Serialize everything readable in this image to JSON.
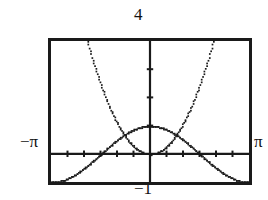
{
  "screen": {
    "name": "graphing-calculator-plot",
    "background": "#ffffff",
    "ink": "#1a1a1a"
  },
  "labels": {
    "y_max": "4",
    "y_min": "−1",
    "x_min": "−π",
    "x_max": "π"
  },
  "chart_data": {
    "type": "line",
    "title": "",
    "xlabel": "",
    "ylabel": "",
    "xlim": [
      -3.14159265,
      3.14159265
    ],
    "ylim": [
      -1,
      4
    ],
    "xlim_labels": [
      "−π",
      "π"
    ],
    "ylim_labels": [
      "−1",
      "4"
    ],
    "grid": false,
    "legend": "none",
    "axes": {
      "x_axis_at_y": 0,
      "y_axis_at_x": 0,
      "x_tick_spacing": 0.5235988,
      "y_tick_spacing": 1,
      "tick_style": "small-marks-on-axes"
    },
    "render_style": "pixelated-dotted-calculator-trace",
    "series": [
      {
        "name": "y = x²",
        "expression": "x^2",
        "x": [
          -3.14159,
          -2.9,
          -2.7,
          -2.5,
          -2.3,
          -2.1,
          -2.0,
          -1.9,
          -1.7,
          -1.5,
          -1.3,
          -1.1,
          -0.9,
          -0.7,
          -0.5,
          -0.3,
          -0.1,
          0,
          0.1,
          0.3,
          0.5,
          0.7,
          0.9,
          1.1,
          1.3,
          1.5,
          1.7,
          1.9,
          2.0,
          2.1,
          2.3,
          2.5,
          2.7,
          2.9,
          3.14159
        ],
        "y": [
          9.8696,
          8.41,
          7.29,
          6.25,
          5.29,
          4.41,
          4.0,
          3.61,
          2.89,
          2.25,
          1.69,
          1.21,
          0.81,
          0.49,
          0.25,
          0.09,
          0.01,
          0,
          0.01,
          0.09,
          0.25,
          0.49,
          0.81,
          1.21,
          1.69,
          2.25,
          2.89,
          3.61,
          4.0,
          4.41,
          5.29,
          6.25,
          7.29,
          8.41,
          9.8696
        ]
      },
      {
        "name": "y = cos(x)",
        "expression": "cos(x)",
        "x": [
          -3.14159,
          -2.88,
          -2.62,
          -2.36,
          -2.09,
          -1.83,
          -1.57,
          -1.31,
          -1.05,
          -0.79,
          -0.52,
          -0.26,
          0,
          0.26,
          0.52,
          0.79,
          1.05,
          1.31,
          1.57,
          1.83,
          2.09,
          2.36,
          2.62,
          2.88,
          3.14159
        ],
        "y": [
          -1.0,
          -0.966,
          -0.866,
          -0.707,
          -0.5,
          -0.259,
          0.0,
          0.259,
          0.5,
          0.707,
          0.866,
          0.966,
          1.0,
          0.966,
          0.866,
          0.707,
          0.5,
          0.259,
          0.0,
          -0.259,
          -0.5,
          -0.707,
          -0.866,
          -0.966,
          -1.0
        ]
      }
    ],
    "intersections_visible": [
      {
        "x": -0.824,
        "y": 0.679
      },
      {
        "x": 0.824,
        "y": 0.679
      }
    ]
  }
}
